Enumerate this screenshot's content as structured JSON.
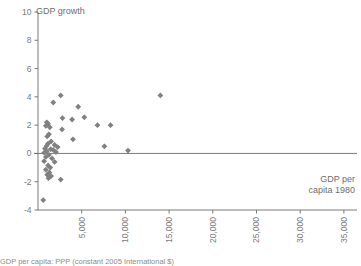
{
  "chart_data": {
    "type": "scatter",
    "title": "",
    "ylabel": "GDP growth",
    "xlabel": "GDP per\ncapita 1980",
    "xlabel_line1": "GDP per",
    "xlabel_line2": "capita 1980",
    "ylim": [
      -4,
      10
    ],
    "xlim": [
      0,
      36500
    ],
    "grid": false,
    "legend": null,
    "marker": "diamond",
    "marker_color": "#808080",
    "zero_line": true,
    "x_ticks": [
      5000,
      10000,
      15000,
      20000,
      25000,
      30000,
      35000
    ],
    "x_tick_labels": [
      "5,000",
      "10,000",
      "15,000",
      "20,000",
      "25,000",
      "30,000",
      "35,000"
    ],
    "x_tick_rotation": -90,
    "y_ticks": [
      -4,
      -2,
      0,
      2,
      4,
      6,
      8,
      10
    ],
    "y_tick_labels": [
      "-4",
      "-2",
      "0",
      "2",
      "4",
      "6",
      "8",
      "10"
    ],
    "points": [
      {
        "x": 2600,
        "y": 4.1
      },
      {
        "x": 1750,
        "y": 3.6
      },
      {
        "x": 4600,
        "y": 3.3
      },
      {
        "x": 14000,
        "y": 4.1
      },
      {
        "x": 2800,
        "y": 2.5
      },
      {
        "x": 3900,
        "y": 2.4
      },
      {
        "x": 5300,
        "y": 2.55
      },
      {
        "x": 8300,
        "y": 2.0
      },
      {
        "x": 1000,
        "y": 2.2
      },
      {
        "x": 1150,
        "y": 2.1
      },
      {
        "x": 900,
        "y": 1.95
      },
      {
        "x": 1350,
        "y": 1.85
      },
      {
        "x": 2750,
        "y": 1.7
      },
      {
        "x": 1250,
        "y": 1.35
      },
      {
        "x": 1050,
        "y": 1.2
      },
      {
        "x": 4000,
        "y": 1.0
      },
      {
        "x": 6800,
        "y": 2.0
      },
      {
        "x": 1500,
        "y": 0.85
      },
      {
        "x": 1150,
        "y": 0.7
      },
      {
        "x": 1900,
        "y": 0.6
      },
      {
        "x": 1000,
        "y": 0.55
      },
      {
        "x": 2250,
        "y": 0.45
      },
      {
        "x": 800,
        "y": 0.35
      },
      {
        "x": 1450,
        "y": 0.3
      },
      {
        "x": 1750,
        "y": 0.25
      },
      {
        "x": 1000,
        "y": 0.15
      },
      {
        "x": 2050,
        "y": 0.1
      },
      {
        "x": 7600,
        "y": 0.5
      },
      {
        "x": 10300,
        "y": 0.2
      },
      {
        "x": 700,
        "y": 0.05
      },
      {
        "x": 1250,
        "y": -0.1
      },
      {
        "x": 900,
        "y": -0.25
      },
      {
        "x": 1600,
        "y": -0.35
      },
      {
        "x": 700,
        "y": -0.55
      },
      {
        "x": 1900,
        "y": -0.6
      },
      {
        "x": 1150,
        "y": -0.85
      },
      {
        "x": 1400,
        "y": -1.0
      },
      {
        "x": 900,
        "y": -1.15
      },
      {
        "x": 1300,
        "y": -1.35
      },
      {
        "x": 1050,
        "y": -1.5
      },
      {
        "x": 1500,
        "y": -1.6
      },
      {
        "x": 1200,
        "y": -1.75
      },
      {
        "x": 2600,
        "y": -1.85
      },
      {
        "x": 600,
        "y": -3.3
      }
    ]
  },
  "caption": {
    "text": "GDP per capita: PPP (constant 2005 International $)"
  }
}
